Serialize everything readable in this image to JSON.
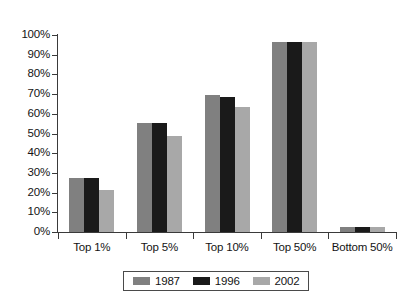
{
  "chart_data": {
    "type": "bar",
    "title": "",
    "subtitle": "",
    "xlabel": "",
    "ylabel": "",
    "ylim": [
      0,
      100
    ],
    "ytick_labels": [
      "100%",
      "90%",
      "80%",
      "70%",
      "60%",
      "50%",
      "40%",
      "30%",
      "20%",
      "10%",
      "0%"
    ],
    "ytick_values": [
      100,
      90,
      80,
      70,
      60,
      50,
      40,
      30,
      20,
      10,
      0
    ],
    "grid": false,
    "legend_position": "bottom-center",
    "categories": [
      "Top 1%",
      "Top 5%",
      "Top 10%",
      "Top 50%",
      "Bottom 50%"
    ],
    "series": [
      {
        "name": "1987",
        "color": "#808080",
        "values": [
          27.5,
          55.5,
          69.5,
          96.5,
          2.3
        ]
      },
      {
        "name": "1996",
        "color": "#1a1a1a",
        "values": [
          27.5,
          55.5,
          68.5,
          96.5,
          2.3
        ]
      },
      {
        "name": "2002",
        "color": "#a8a8a8",
        "values": [
          21.5,
          48.5,
          63.5,
          96.5,
          2.3
        ]
      }
    ]
  },
  "legend": {
    "entries": [
      {
        "label": "1987",
        "color": "#808080"
      },
      {
        "label": "1996",
        "color": "#1a1a1a"
      },
      {
        "label": "2002",
        "color": "#a8a8a8"
      }
    ]
  },
  "axis": {
    "y_ticks": [
      "100%",
      "90%",
      "80%",
      "70%",
      "60%",
      "50%",
      "40%",
      "30%",
      "20%",
      "10%",
      "0%"
    ],
    "x_ticks": [
      "Top 1%",
      "Top 5%",
      "Top 10%",
      "Top 50%",
      "Bottom 50%"
    ]
  }
}
